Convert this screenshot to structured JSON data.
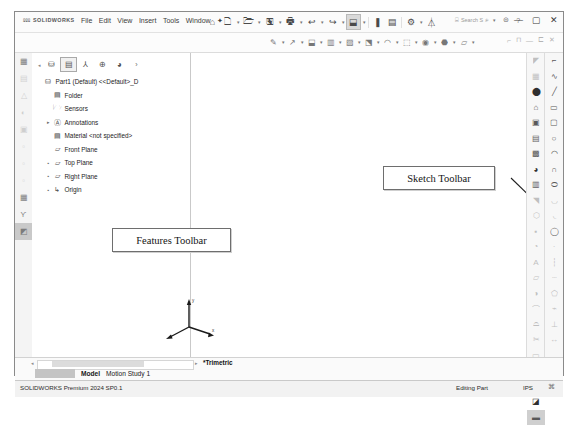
{
  "app": {
    "brand": "SOLIDWORKS",
    "brand_mark": "⅏"
  },
  "menu": {
    "items": [
      "File",
      "Edit",
      "View",
      "Insert",
      "Tools",
      "Window"
    ],
    "pin": "✦"
  },
  "quick_access": {
    "icons": [
      {
        "name": "home-icon",
        "glyph": "⌂",
        "caret": false
      },
      {
        "name": "new-document-icon",
        "glyph": "🗋",
        "caret": true
      },
      {
        "name": "open-document-icon",
        "glyph": "🗁",
        "caret": true
      },
      {
        "name": "save-icon",
        "glyph": "🖫",
        "caret": true
      },
      {
        "name": "print-icon",
        "glyph": "🖶",
        "caret": true
      },
      {
        "name": "undo-icon",
        "glyph": "↩",
        "caret": true
      },
      {
        "name": "redo-icon",
        "glyph": "↪",
        "caret": true
      },
      {
        "name": "select-icon",
        "glyph": "⬓",
        "caret": true,
        "selected": true
      },
      {
        "name": "rebuild-icon",
        "glyph": "❚",
        "caret": false
      },
      {
        "name": "options-grid-icon",
        "glyph": "▤",
        "caret": false
      },
      {
        "name": "settings-gear-icon",
        "glyph": "⚙",
        "caret": true
      },
      {
        "name": "user-account-icon",
        "glyph": "⏃",
        "caret": false
      }
    ]
  },
  "search": {
    "placeholder": "Search S",
    "icon": "search-icon",
    "caret": "▾",
    "help_icons": [
      "⊜",
      "?"
    ]
  },
  "window_controls": {
    "minimize": "—",
    "maximize": "▢",
    "close": "✕"
  },
  "toolbar_strip": {
    "icons": [
      {
        "name": "sketch-pencil-icon",
        "glyph": "✎"
      },
      {
        "name": "smart-dimension-icon",
        "glyph": "↗"
      },
      {
        "name": "extrude-boss-icon",
        "glyph": "⬓"
      },
      {
        "name": "revolve-boss-icon",
        "glyph": "▥"
      },
      {
        "name": "swept-boss-icon",
        "glyph": "▨"
      },
      {
        "name": "extruded-cut-icon",
        "glyph": "⬔"
      },
      {
        "name": "fillet-icon",
        "glyph": "◠"
      },
      {
        "name": "linear-pattern-icon",
        "glyph": "⬚"
      },
      {
        "name": "rib-icon",
        "glyph": "◉"
      },
      {
        "name": "draft-icon",
        "glyph": "⬣"
      },
      {
        "name": "reference-geometry-icon",
        "glyph": "▱"
      }
    ],
    "right_controls": [
      "⌐",
      "⊓",
      "—",
      "⊏",
      "✕"
    ]
  },
  "left_task_strip": {
    "items": [
      {
        "name": "design-library-icon",
        "glyph": "▦",
        "dim": false
      },
      {
        "name": "file-explorer-icon",
        "glyph": "▤",
        "dim": true
      },
      {
        "name": "view-palette-icon",
        "glyph": "△",
        "dim": true
      },
      {
        "name": "appearances-icon",
        "glyph": "◐",
        "dim": true
      },
      {
        "name": "custom-properties-icon",
        "glyph": "▣",
        "dim": true
      },
      {
        "name": "blank-tool-icon",
        "glyph": "▫",
        "dim": true
      },
      {
        "name": "blank-tool2-icon",
        "glyph": "▫",
        "dim": true
      },
      {
        "name": "blank-tool3-icon",
        "glyph": "▫",
        "dim": true
      },
      {
        "name": "assembly-icon",
        "glyph": "▦",
        "dim": false
      },
      {
        "name": "sketch-spline-icon",
        "glyph": "Ƴ",
        "dim": false
      },
      {
        "name": "section-view-icon",
        "glyph": "◩",
        "dim": false,
        "box": true
      }
    ]
  },
  "feature_manager": {
    "tabs": [
      {
        "name": "feature-tree-tab",
        "glyph": "⛁",
        "on": false
      },
      {
        "name": "property-manager-tab",
        "glyph": "▤",
        "on": true
      },
      {
        "name": "configuration-manager-tab",
        "glyph": "⅄",
        "on": false
      },
      {
        "name": "dimxpert-tab",
        "glyph": "⊕",
        "on": false
      },
      {
        "name": "display-manager-tab",
        "glyph": "◕",
        "on": false
      },
      {
        "name": "expand-tab",
        "glyph": "›",
        "on": false
      }
    ],
    "tree": [
      {
        "name": "tree-item-part1",
        "label": "Part1 (Default) <<Default>_D",
        "icon": "part-icon",
        "glyph": "⛁",
        "indent": 0,
        "toggle": ""
      },
      {
        "name": "tree-item-history-folder",
        "label": "Folder",
        "icon": "history-folder-icon",
        "glyph": "▤",
        "indent": 1,
        "toggle": ""
      },
      {
        "name": "tree-item-sensors",
        "label": "Sensors",
        "icon": "sensors-icon",
        "glyph": "🗁",
        "indent": 1,
        "toggle": ""
      },
      {
        "name": "tree-item-annotations",
        "label": "Annotations",
        "icon": "annotations-icon",
        "glyph": "Ⓐ",
        "indent": 1,
        "toggle": "▸"
      },
      {
        "name": "tree-item-material",
        "label": "Material <not specified>",
        "icon": "material-icon",
        "glyph": "▤",
        "indent": 1,
        "toggle": ""
      },
      {
        "name": "tree-item-front-plane",
        "label": "Front Plane",
        "icon": "plane-icon",
        "glyph": "▱",
        "indent": 1,
        "toggle": ""
      },
      {
        "name": "tree-item-top-plane",
        "label": "Top Plane",
        "icon": "plane-icon",
        "glyph": "▱",
        "indent": 1,
        "toggle": "▪"
      },
      {
        "name": "tree-item-right-plane",
        "label": "Right Plane",
        "icon": "plane-icon",
        "glyph": "▱",
        "indent": 1,
        "toggle": "▪"
      },
      {
        "name": "tree-item-origin",
        "label": "Origin",
        "icon": "origin-icon",
        "glyph": "↳",
        "indent": 1,
        "toggle": "▪"
      }
    ]
  },
  "callouts": [
    {
      "name": "features-toolbar-callout",
      "label": "Features Toolbar"
    },
    {
      "name": "sketch-toolbar-callout",
      "label": "Sketch Toolbar"
    }
  ],
  "sketch_toolbar_inner": {
    "items": [
      {
        "name": "select-arrow-icon",
        "glyph": "◤",
        "dim": true
      },
      {
        "name": "grid-snap-icon",
        "glyph": "▦",
        "dim": true
      },
      {
        "name": "sketch-mode-icon",
        "glyph": "⬤",
        "dark": true
      },
      {
        "name": "home-view-icon",
        "glyph": "⌂"
      },
      {
        "name": "isometric-view-icon",
        "glyph": "▣"
      },
      {
        "name": "section-view-icon",
        "glyph": "▤"
      },
      {
        "name": "display-style-icon",
        "glyph": "▩"
      },
      {
        "name": "appearance-sphere-icon",
        "glyph": "◕",
        "dark": true
      },
      {
        "name": "scene-icon",
        "glyph": "▥"
      },
      {
        "name": "select-pointer-icon",
        "glyph": "◥",
        "dim": true
      },
      {
        "name": "hex-polygon-icon",
        "glyph": "⬡",
        "dim": true
      },
      {
        "name": "point-icon",
        "glyph": "▪",
        "dim": true
      },
      {
        "name": "sketch-fillet-icon",
        "glyph": "◔",
        "dim": true
      },
      {
        "name": "text-tool-icon",
        "glyph": "A",
        "dim": true
      },
      {
        "name": "plane-tool-icon",
        "glyph": "▱",
        "dim": true
      },
      {
        "name": "mirror-entities-icon",
        "glyph": "◑",
        "dim": true
      },
      {
        "name": "curve-icon",
        "glyph": "⌒",
        "dim": true
      },
      {
        "name": "offset-icon",
        "glyph": "⌓",
        "dim": true
      },
      {
        "name": "trim-icon",
        "glyph": "✂",
        "dim": true
      },
      {
        "name": "convert-entities-icon",
        "glyph": "▭",
        "dim": true
      },
      {
        "name": "linear-sketch-pattern-icon",
        "glyph": "▦",
        "dim": true
      },
      {
        "name": "move-entities-icon",
        "glyph": "✛",
        "dim": true
      },
      {
        "name": "repair-sketch-icon",
        "glyph": "◪",
        "dark": true
      },
      {
        "name": "sketch-picture-icon",
        "glyph": "▬",
        "fill": true
      }
    ]
  },
  "sketch_toolbar_outer": {
    "items": [
      {
        "name": "corner-rectangle-icon",
        "glyph": "⌐"
      },
      {
        "name": "spline-icon",
        "glyph": "∿"
      },
      {
        "name": "line-icon",
        "glyph": "╱"
      },
      {
        "name": "rectangle-icon",
        "glyph": "▭"
      },
      {
        "name": "slot-icon",
        "glyph": "▢"
      },
      {
        "name": "circle-icon",
        "glyph": "○"
      },
      {
        "name": "arc-icon",
        "glyph": "◠"
      },
      {
        "name": "three-point-arc-icon",
        "glyph": "∩"
      },
      {
        "name": "ellipse-icon",
        "glyph": "⬭"
      },
      {
        "name": "parabola-icon",
        "glyph": "◡",
        "dim": true
      },
      {
        "name": "conic-icon",
        "glyph": "◟",
        "dim": true
      },
      {
        "name": "circle-centerpoint-icon",
        "glyph": "◯"
      },
      {
        "name": "dot-entity-icon",
        "glyph": "·",
        "dim": true
      },
      {
        "name": "centerline-icon",
        "glyph": "┆",
        "dim": true
      },
      {
        "name": "midpoint-line-icon",
        "glyph": "┄",
        "dim": true
      },
      {
        "name": "polygon-icon",
        "glyph": "⬠",
        "dim": true
      },
      {
        "name": "construction-geometry-icon",
        "glyph": "⌁",
        "dim": true
      },
      {
        "name": "sketch-relation-icon",
        "glyph": "⊥",
        "dim": true
      },
      {
        "name": "smart-dimension-icon",
        "glyph": "↔",
        "dim": true
      }
    ]
  },
  "bottom": {
    "view_name": "*Trimetric",
    "tabs": [
      {
        "name": "tab-model",
        "label": "Model",
        "active": true
      },
      {
        "name": "tab-motion-study",
        "label": "Motion Study 1",
        "active": false
      }
    ],
    "scroll_left_arrow": "◂",
    "scroll_right_arrow": "▸"
  },
  "status": {
    "product": "SOLIDWORKS Premium 2024 SP0.1",
    "mode": "Editing Part",
    "units": "IPS",
    "icon": "⌘"
  }
}
